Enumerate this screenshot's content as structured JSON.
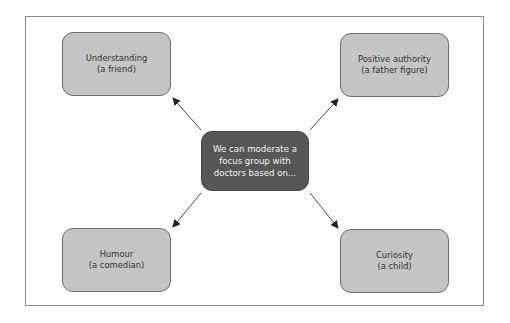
{
  "diagram": {
    "type": "mind-map",
    "center": {
      "lines": [
        "We can moderate a",
        "focus group with",
        "doctors based on..."
      ],
      "fill": "#575757",
      "text_color": "#f2f2f2"
    },
    "nodes": [
      {
        "id": "top-left",
        "lines": [
          "Understanding",
          "(a friend)"
        ]
      },
      {
        "id": "top-right",
        "lines": [
          "Positive authority",
          "(a father figure)"
        ]
      },
      {
        "id": "bottom-left",
        "lines": [
          "Humour",
          "(a comedian)"
        ]
      },
      {
        "id": "bottom-right",
        "lines": [
          "Curiosity",
          "(a child)"
        ]
      }
    ],
    "node_fill": "#c4c4c4",
    "node_border": "#6e6e6e",
    "arrow_color": "#333333",
    "edges": [
      {
        "from": "center",
        "to": "top-left"
      },
      {
        "from": "center",
        "to": "top-right"
      },
      {
        "from": "center",
        "to": "bottom-left"
      },
      {
        "from": "center",
        "to": "bottom-right"
      }
    ]
  }
}
